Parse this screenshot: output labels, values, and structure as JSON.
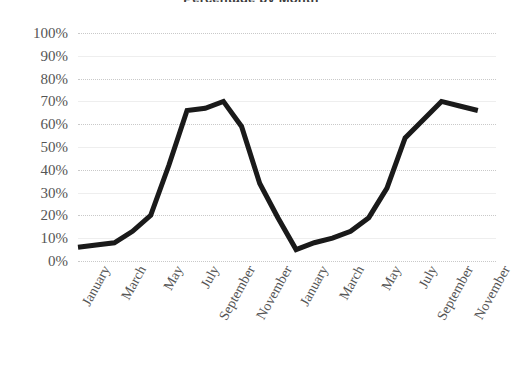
{
  "chart_data": {
    "type": "line",
    "title": "Percentage by Month",
    "xlabel": "",
    "ylabel": "",
    "ylim": [
      0,
      100
    ],
    "grid": true,
    "legend": "none",
    "y_ticks": [
      "100%",
      "90%",
      "80%",
      "70%",
      "60%",
      "50%",
      "40%",
      "30%",
      "20%",
      "10%",
      "0%"
    ],
    "y_tick_values": [
      100,
      90,
      80,
      70,
      60,
      50,
      40,
      30,
      20,
      10,
      0
    ],
    "x_tick_labels": [
      "January",
      "March",
      "May",
      "July",
      "September",
      "November",
      "January",
      "March",
      "May",
      "July",
      "September",
      "November"
    ],
    "categories": [
      "January",
      "February",
      "March",
      "April",
      "May",
      "June",
      "July",
      "August",
      "September",
      "October",
      "November",
      "December",
      "January",
      "February",
      "March",
      "April",
      "May",
      "June",
      "July",
      "August",
      "September",
      "October",
      "November",
      "December"
    ],
    "values": [
      6,
      7,
      8,
      13,
      20,
      42,
      66,
      67,
      70,
      59,
      34,
      19,
      5,
      8,
      10,
      13,
      19,
      32,
      54,
      62,
      70,
      68,
      66,
      null
    ],
    "series": [
      {
        "name": "Percentage",
        "color": "#1a1a1a",
        "line_width": 5,
        "markers": false,
        "values": [
          6,
          7,
          8,
          13,
          20,
          42,
          66,
          67,
          70,
          59,
          34,
          19,
          5,
          8,
          10,
          13,
          19,
          32,
          54,
          62,
          70,
          68,
          66,
          null
        ]
      }
    ]
  },
  "axes": {
    "y_label_color": "#555555",
    "x_label_color": "#555555",
    "gridline_color": "#c9c9c9"
  }
}
